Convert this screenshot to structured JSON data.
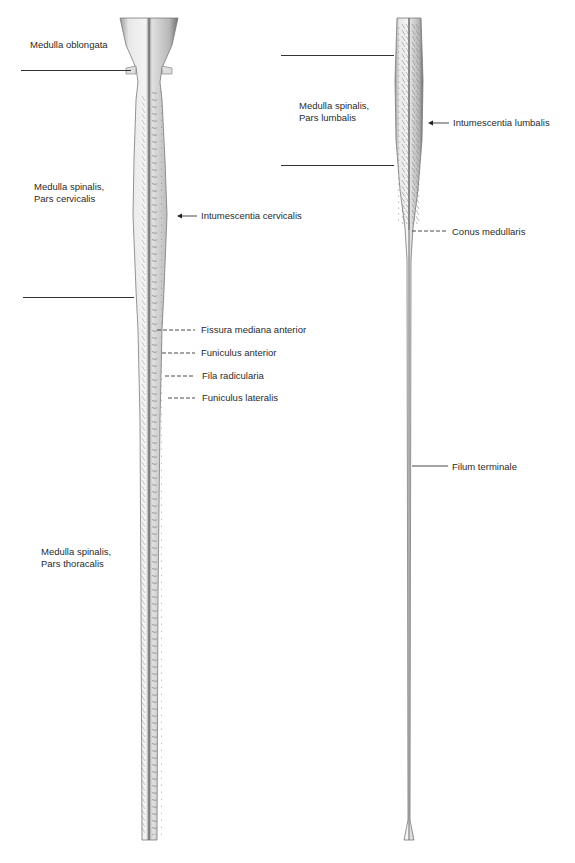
{
  "figure": {
    "left_panel": {
      "name": "spinal-cord-upper",
      "region_labels": [
        {
          "id": "medulla-oblongata",
          "text": "Medulla oblongata"
        },
        {
          "id": "pars-cervicalis",
          "text": "Medulla spinalis,\nPars cervicalis"
        },
        {
          "id": "pars-thoracalis",
          "text": "Medulla spinalis,\nPars thoracalis"
        }
      ],
      "annotations": [
        {
          "id": "intumescentia-cervicalis",
          "text": "Intumescentia cervicalis",
          "leader": "arrow"
        },
        {
          "id": "fissura-mediana-anterior",
          "text": "Fissura mediana anterior",
          "leader": "dashed"
        },
        {
          "id": "funiculus-anterior",
          "text": "Funiculus anterior",
          "leader": "dashed"
        },
        {
          "id": "fila-radicularia",
          "text": "Fila radicularia",
          "leader": "dashed"
        },
        {
          "id": "funiculus-lateralis",
          "text": "Funiculus lateralis",
          "leader": "dashed"
        }
      ]
    },
    "right_panel": {
      "name": "spinal-cord-lower",
      "region_labels": [
        {
          "id": "pars-lumbalis",
          "text": "Medulla spinalis,\nPars lumbalis"
        }
      ],
      "annotations": [
        {
          "id": "intumescentia-lumbalis",
          "text": "Intumescentia lumbalis",
          "leader": "arrow"
        },
        {
          "id": "conus-medullaris",
          "text": "Conus medullaris",
          "leader": "dashed"
        },
        {
          "id": "filum-terminale",
          "text": "Filum terminale",
          "leader": "solid"
        }
      ]
    },
    "colors": {
      "background": "#ffffff",
      "text": "#2a2a2a",
      "lines": "#333333",
      "cord_light": "#eeeeee",
      "cord_mid": "#bdbdbd",
      "cord_dark": "#7a7a7a"
    }
  }
}
